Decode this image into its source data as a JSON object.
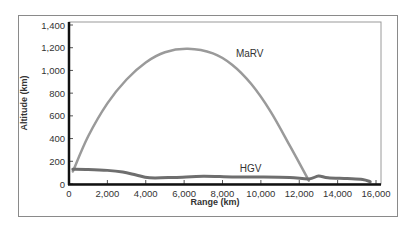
{
  "chart_data": {
    "type": "line",
    "title": "",
    "xlabel": "Range (km)",
    "ylabel": "Altitude (km)",
    "xlim": [
      0,
      16000
    ],
    "ylim": [
      0,
      1400
    ],
    "xticks": [
      0,
      2000,
      4000,
      6000,
      8000,
      10000,
      12000,
      14000,
      16000
    ],
    "xtick_labels": [
      "0",
      "2,000",
      "4,000",
      "6,000",
      "8,000",
      "10,000",
      "12,000",
      "14,000",
      "16,000"
    ],
    "yticks": [
      0,
      200,
      400,
      600,
      800,
      1000,
      1200,
      1400
    ],
    "ytick_labels": [
      "0",
      "200",
      "400",
      "600",
      "800",
      "1,000",
      "1,200",
      "1,400"
    ],
    "grid": false,
    "legend": "inline labels",
    "series": [
      {
        "name": "MaRV",
        "color": "#9a9a9a",
        "x": [
          200,
          1000,
          2000,
          3000,
          4000,
          5000,
          6200,
          7500,
          8500,
          9500,
          10500,
          11500,
          12500
        ],
        "y": [
          110,
          420,
          710,
          920,
          1070,
          1160,
          1190,
          1150,
          1050,
          880,
          640,
          340,
          30
        ]
      },
      {
        "name": "HGV",
        "color": "#6e6e6e",
        "x": [
          200,
          1000,
          2000,
          2800,
          3500,
          4200,
          5500,
          7000,
          8500,
          10000,
          11500,
          12500,
          13000,
          13500,
          14500,
          15300,
          15700
        ],
        "y": [
          130,
          128,
          120,
          105,
          80,
          55,
          58,
          68,
          62,
          62,
          58,
          45,
          70,
          55,
          48,
          40,
          20
        ]
      }
    ],
    "annotations": [
      {
        "text": "MaRV",
        "x": 8700,
        "y": 1120
      },
      {
        "text": "HGV",
        "x": 8900,
        "y": 110
      }
    ]
  }
}
